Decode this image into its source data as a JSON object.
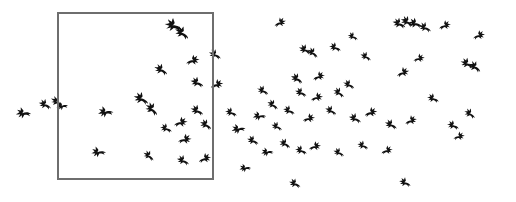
{
  "scene": {
    "title": "Flock of birds in flight",
    "width": 516,
    "height": 202,
    "background_color": "#ffffff",
    "bird_color": "#111111",
    "description": "Black silhouettes of many birds in flight against a plain white background, with a thin rectangular outline drawn over the left portion of the flock."
  },
  "selection_rectangle": {
    "label": "selection-box",
    "stroke_color": "#6e6e6e",
    "stroke_width": 1.1,
    "fill": "none",
    "x": 58,
    "y": 13,
    "width": 155,
    "height": 166
  },
  "flock": {
    "label": "bird-flock",
    "total_birds": 74,
    "birds_inside_rectangle": 22,
    "birds_outside_rectangle": 52,
    "birds": [
      {
        "x": 22,
        "y": 113,
        "s": 1.05,
        "r": -8,
        "f": 1
      },
      {
        "x": 44,
        "y": 104,
        "s": 0.92,
        "r": 18,
        "f": 1
      },
      {
        "x": 56,
        "y": 101,
        "s": 0.95,
        "r": 30,
        "f": 1
      },
      {
        "x": 61,
        "y": 106,
        "s": 0.8,
        "r": -15,
        "f": 1
      },
      {
        "x": 172,
        "y": 25,
        "s": 1.25,
        "r": 12,
        "f": 1
      },
      {
        "x": 181,
        "y": 32,
        "s": 1.1,
        "r": 28,
        "f": 1
      },
      {
        "x": 160,
        "y": 69,
        "s": 1.0,
        "r": 22,
        "f": 1
      },
      {
        "x": 194,
        "y": 60,
        "s": 0.95,
        "r": -10,
        "f": 0
      },
      {
        "x": 214,
        "y": 54,
        "s": 0.9,
        "r": 20,
        "f": 1
      },
      {
        "x": 196,
        "y": 82,
        "s": 0.95,
        "r": 16,
        "f": 1
      },
      {
        "x": 218,
        "y": 84,
        "s": 0.9,
        "r": -12,
        "f": 0
      },
      {
        "x": 140,
        "y": 98,
        "s": 1.1,
        "r": 20,
        "f": 1
      },
      {
        "x": 151,
        "y": 108,
        "s": 1.05,
        "r": 35,
        "f": 1
      },
      {
        "x": 104,
        "y": 112,
        "s": 1.05,
        "r": -12,
        "f": 1
      },
      {
        "x": 196,
        "y": 110,
        "s": 0.95,
        "r": 18,
        "f": 1
      },
      {
        "x": 182,
        "y": 122,
        "s": 0.95,
        "r": -8,
        "f": 0
      },
      {
        "x": 205,
        "y": 124,
        "s": 0.9,
        "r": 25,
        "f": 1
      },
      {
        "x": 165,
        "y": 128,
        "s": 0.85,
        "r": 14,
        "f": 1
      },
      {
        "x": 186,
        "y": 139,
        "s": 0.95,
        "r": -6,
        "f": 0
      },
      {
        "x": 97,
        "y": 152,
        "s": 1.0,
        "r": -10,
        "f": 1
      },
      {
        "x": 148,
        "y": 155,
        "s": 0.85,
        "r": 30,
        "f": 1
      },
      {
        "x": 182,
        "y": 160,
        "s": 0.9,
        "r": 18,
        "f": 1
      },
      {
        "x": 206,
        "y": 158,
        "s": 0.9,
        "r": -14,
        "f": 0
      },
      {
        "x": 230,
        "y": 112,
        "s": 0.85,
        "r": 14,
        "f": 1
      },
      {
        "x": 237,
        "y": 129,
        "s": 0.95,
        "r": -16,
        "f": 1
      },
      {
        "x": 281,
        "y": 22,
        "s": 0.85,
        "r": -18,
        "f": 0
      },
      {
        "x": 304,
        "y": 49,
        "s": 0.9,
        "r": 20,
        "f": 1
      },
      {
        "x": 312,
        "y": 52,
        "s": 0.85,
        "r": 30,
        "f": 1
      },
      {
        "x": 334,
        "y": 47,
        "s": 0.85,
        "r": 14,
        "f": 1
      },
      {
        "x": 365,
        "y": 56,
        "s": 0.8,
        "r": 22,
        "f": 1
      },
      {
        "x": 398,
        "y": 23,
        "s": 0.95,
        "r": 16,
        "f": 1
      },
      {
        "x": 406,
        "y": 21,
        "s": 0.95,
        "r": 24,
        "f": 1
      },
      {
        "x": 414,
        "y": 23,
        "s": 0.95,
        "r": 10,
        "f": 1
      },
      {
        "x": 424,
        "y": 27,
        "s": 0.9,
        "r": 18,
        "f": 1
      },
      {
        "x": 446,
        "y": 25,
        "s": 0.85,
        "r": -14,
        "f": 0
      },
      {
        "x": 480,
        "y": 35,
        "s": 0.85,
        "r": -12,
        "f": 0
      },
      {
        "x": 466,
        "y": 63,
        "s": 0.95,
        "r": 18,
        "f": 1
      },
      {
        "x": 474,
        "y": 66,
        "s": 0.95,
        "r": 28,
        "f": 1
      },
      {
        "x": 296,
        "y": 78,
        "s": 0.9,
        "r": 24,
        "f": 1
      },
      {
        "x": 320,
        "y": 76,
        "s": 0.85,
        "r": -14,
        "f": 0
      },
      {
        "x": 348,
        "y": 84,
        "s": 0.85,
        "r": 20,
        "f": 1
      },
      {
        "x": 300,
        "y": 92,
        "s": 0.85,
        "r": 18,
        "f": 1
      },
      {
        "x": 318,
        "y": 97,
        "s": 0.85,
        "r": -10,
        "f": 0
      },
      {
        "x": 338,
        "y": 92,
        "s": 0.85,
        "r": 26,
        "f": 1
      },
      {
        "x": 404,
        "y": 72,
        "s": 0.9,
        "r": -16,
        "f": 0
      },
      {
        "x": 432,
        "y": 98,
        "s": 0.85,
        "r": 14,
        "f": 1
      },
      {
        "x": 262,
        "y": 90,
        "s": 0.85,
        "r": 20,
        "f": 1
      },
      {
        "x": 258,
        "y": 116,
        "s": 0.9,
        "r": -12,
        "f": 1
      },
      {
        "x": 272,
        "y": 104,
        "s": 0.85,
        "r": 28,
        "f": 1
      },
      {
        "x": 288,
        "y": 110,
        "s": 0.85,
        "r": 16,
        "f": 1
      },
      {
        "x": 310,
        "y": 118,
        "s": 0.85,
        "r": -8,
        "f": 0
      },
      {
        "x": 330,
        "y": 110,
        "s": 0.85,
        "r": 22,
        "f": 1
      },
      {
        "x": 354,
        "y": 118,
        "s": 0.9,
        "r": 18,
        "f": 1
      },
      {
        "x": 372,
        "y": 112,
        "s": 0.9,
        "r": -12,
        "f": 0
      },
      {
        "x": 390,
        "y": 124,
        "s": 0.9,
        "r": 20,
        "f": 1
      },
      {
        "x": 412,
        "y": 120,
        "s": 0.85,
        "r": -16,
        "f": 0
      },
      {
        "x": 452,
        "y": 125,
        "s": 0.85,
        "r": 14,
        "f": 1
      },
      {
        "x": 469,
        "y": 113,
        "s": 0.85,
        "r": 26,
        "f": 1
      },
      {
        "x": 460,
        "y": 136,
        "s": 0.8,
        "r": -10,
        "f": 0
      },
      {
        "x": 252,
        "y": 140,
        "s": 0.85,
        "r": 18,
        "f": 1
      },
      {
        "x": 266,
        "y": 152,
        "s": 0.85,
        "r": -14,
        "f": 1
      },
      {
        "x": 284,
        "y": 143,
        "s": 0.85,
        "r": 24,
        "f": 1
      },
      {
        "x": 300,
        "y": 150,
        "s": 0.85,
        "r": 14,
        "f": 1
      },
      {
        "x": 316,
        "y": 146,
        "s": 0.85,
        "r": -10,
        "f": 0
      },
      {
        "x": 338,
        "y": 152,
        "s": 0.8,
        "r": 20,
        "f": 1
      },
      {
        "x": 362,
        "y": 145,
        "s": 0.8,
        "r": 16,
        "f": 1
      },
      {
        "x": 388,
        "y": 150,
        "s": 0.8,
        "r": -12,
        "f": 0
      },
      {
        "x": 294,
        "y": 183,
        "s": 0.85,
        "r": 18,
        "f": 1
      },
      {
        "x": 404,
        "y": 182,
        "s": 0.85,
        "r": 16,
        "f": 1
      },
      {
        "x": 244,
        "y": 168,
        "s": 0.8,
        "r": -14,
        "f": 1
      },
      {
        "x": 276,
        "y": 126,
        "s": 0.8,
        "r": 20,
        "f": 1
      },
      {
        "x": 420,
        "y": 58,
        "s": 0.8,
        "r": -10,
        "f": 0
      },
      {
        "x": 352,
        "y": 36,
        "s": 0.75,
        "r": 18,
        "f": 1
      }
    ]
  }
}
